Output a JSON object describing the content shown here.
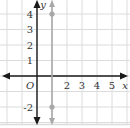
{
  "chart_data": {
    "type": "line",
    "title": "",
    "xlabel": "x",
    "ylabel": "y",
    "origin_label": "O",
    "xlim": [
      -2.3,
      5.9
    ],
    "ylim": [
      -2.6,
      4.8
    ],
    "grid": true,
    "x_tick_labels": [
      "2",
      "3",
      "4",
      "5"
    ],
    "x_tick_values": [
      2,
      3,
      4,
      5
    ],
    "y_tick_labels": [
      "4",
      "3",
      "2",
      "1",
      "-2"
    ],
    "y_tick_values": [
      4,
      3,
      2,
      1,
      -2
    ],
    "series": [
      {
        "name": "x = 1",
        "kind": "vertical-line",
        "x": 1,
        "points": [
          {
            "x": 1,
            "y": 4
          },
          {
            "x": 1,
            "y": -2
          }
        ],
        "arrows": "both"
      }
    ],
    "colors": {
      "axis": "#1a1a1a",
      "grid": "#dcdcdc",
      "series": "#a8a8a8"
    }
  }
}
